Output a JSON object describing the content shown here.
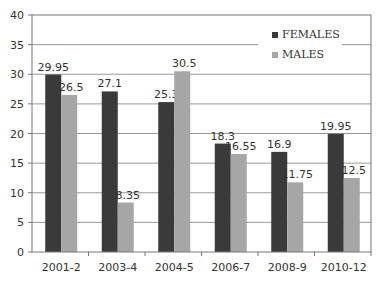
{
  "chart_data": {
    "type": "bar",
    "title": "",
    "xlabel": "",
    "ylabel": "",
    "ylim": [
      0,
      40
    ],
    "yticks": [
      0,
      5,
      10,
      15,
      20,
      25,
      30,
      35,
      40
    ],
    "grid": true,
    "legend_position": "top-right",
    "categories": [
      "2001-2",
      "2003-4",
      "2004-5",
      "2006-7",
      "2008-9",
      "2010-12"
    ],
    "series": [
      {
        "name": "FEMALES",
        "color": "#3a3a3a",
        "values": [
          29.95,
          27.1,
          25.3,
          18.3,
          16.9,
          19.95
        ],
        "labels": [
          "29.95",
          "27.1",
          "25.3",
          "18.3",
          "16.9",
          "19.95"
        ]
      },
      {
        "name": "MALES",
        "color": "#a6a6a6",
        "values": [
          26.5,
          8.35,
          30.5,
          16.55,
          11.75,
          12.5
        ],
        "labels": [
          "26.5",
          "8.35",
          "30.5",
          "16.55",
          "11.75",
          "12.5"
        ]
      }
    ]
  }
}
